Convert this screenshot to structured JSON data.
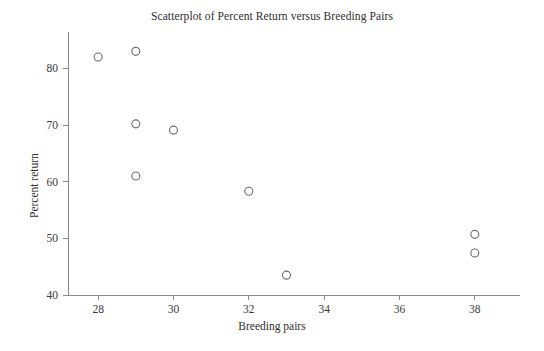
{
  "chart_data": {
    "type": "scatter",
    "title": "Scatterplot of Percent Return versus Breeding Pairs",
    "xlabel": "Breeding pairs",
    "ylabel": "Percent return",
    "xlim": [
      27.2,
      39.2
    ],
    "ylim": [
      40,
      85
    ],
    "grid": false,
    "legend": null,
    "marker": "open-circle",
    "x_ticks": [
      28,
      30,
      32,
      34,
      36,
      38
    ],
    "y_ticks": [
      40,
      50,
      60,
      70,
      80
    ],
    "x_tick_labels": [
      "28",
      "30",
      "32",
      "34",
      "36",
      "38"
    ],
    "y_tick_labels": [
      "40",
      "50",
      "60",
      "70",
      "80"
    ],
    "points": [
      {
        "x": 28,
        "y": 82
      },
      {
        "x": 29,
        "y": 83
      },
      {
        "x": 29,
        "y": 70.2
      },
      {
        "x": 29,
        "y": 61
      },
      {
        "x": 30,
        "y": 69.1
      },
      {
        "x": 32,
        "y": 58.3
      },
      {
        "x": 33,
        "y": 43.5
      },
      {
        "x": 38,
        "y": 50.7
      },
      {
        "x": 38,
        "y": 47.4
      }
    ]
  },
  "colors": {
    "axis": "#8a8a8a",
    "marker": "#6b6b6b",
    "text": "#2e2e2e",
    "background": "#ffffff"
  }
}
